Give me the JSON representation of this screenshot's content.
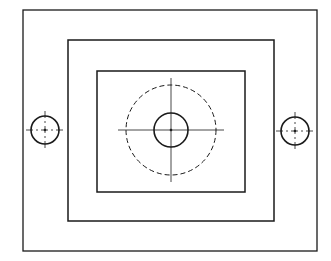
{
  "diagram": {
    "type": "technical-drawing-top-view",
    "line_color": "#1a1a1a",
    "background": "#ffffff",
    "outer_plate": {
      "x": 23,
      "y": 10,
      "w": 294,
      "h": 241
    },
    "middle_step": {
      "x": 68,
      "y": 40,
      "w": 206,
      "h": 181
    },
    "inner_step": {
      "x": 97,
      "y": 71,
      "w": 148,
      "h": 121
    },
    "center_bore": {
      "cx": 171,
      "cy": 130,
      "r": 17
    },
    "hidden_circle": {
      "cx": 171,
      "cy": 130,
      "r": 45
    },
    "left_hole": {
      "cx": 45,
      "cy": 130,
      "r": 14
    },
    "right_hole": {
      "cx": 295,
      "cy": 131,
      "r": 14
    }
  }
}
